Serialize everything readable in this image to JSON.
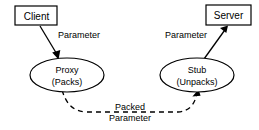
{
  "diagram": {
    "type": "flow-diagram",
    "background_color": "#ffffff",
    "stroke_color": "#000000",
    "nodes": [
      {
        "id": "client",
        "label": "Client",
        "shape": "rectangle",
        "x": 36,
        "y": 15.5,
        "width": 43,
        "height": 20
      },
      {
        "id": "server",
        "label": "Server",
        "shape": "rectangle",
        "x": 228.5,
        "y": 15,
        "width": 45,
        "height": 20
      },
      {
        "id": "proxy",
        "label_line1": "Proxy",
        "label_line2": "(Packs)",
        "shape": "ellipse",
        "x": 67,
        "y": 75,
        "rx": 37,
        "ry": 17
      },
      {
        "id": "stub",
        "label_line1": "Stub",
        "label_line2": "(Unpacks)",
        "shape": "ellipse",
        "x": 197,
        "y": 75,
        "rx": 37,
        "ry": 17
      }
    ],
    "edges": [
      {
        "id": "client-to-proxy",
        "from": "client",
        "to": "proxy",
        "label": "Parameter",
        "style": "solid",
        "arrow": "end"
      },
      {
        "id": "stub-to-server",
        "from": "stub",
        "to": "server",
        "label": "Parameter",
        "style": "solid",
        "arrow": "end"
      },
      {
        "id": "proxy-to-stub",
        "from": "proxy",
        "to": "stub",
        "label_line1": "Packed",
        "label_line2": "Parameter",
        "style": "dashed",
        "arrow": "end"
      }
    ]
  }
}
